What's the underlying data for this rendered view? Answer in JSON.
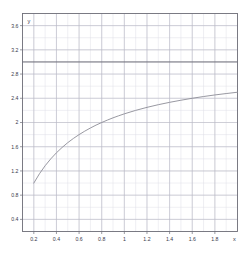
{
  "chart_data": {
    "type": "line",
    "title": "",
    "subtitle": "",
    "xlabel": "x",
    "ylabel": "y",
    "xlim": [
      0.1,
      2.0
    ],
    "ylim": [
      0.2,
      3.8
    ],
    "grid": true,
    "legend": null,
    "x_ticks": [
      "0.2",
      "0.4",
      "0.6",
      "0.8",
      "1",
      "1.2",
      "1.4",
      "1.6",
      "1.8"
    ],
    "x_tick_values": [
      0.2,
      0.4,
      0.6,
      0.8,
      1.0,
      1.2,
      1.4,
      1.6,
      1.8
    ],
    "y_ticks": [
      "0.4",
      "0.8",
      "1.2",
      "1.6",
      "2",
      "2.4",
      "2.8",
      "3.2",
      "3.6"
    ],
    "y_tick_values": [
      0.4,
      0.8,
      1.2,
      1.6,
      2.0,
      2.4,
      2.8,
      3.2,
      3.6
    ],
    "series": [
      {
        "name": "curve",
        "color": "#8c8c96",
        "x": [
          0.2,
          0.25,
          0.3,
          0.35,
          0.4,
          0.45,
          0.5,
          0.55,
          0.6,
          0.65,
          0.7,
          0.75,
          0.8,
          0.85,
          0.9,
          0.95,
          1.0,
          1.1,
          1.2,
          1.3,
          1.4,
          1.5,
          1.6,
          1.7,
          1.8,
          1.9,
          2.0
        ],
        "values": [
          1.0,
          1.154,
          1.286,
          1.4,
          1.5,
          1.588,
          1.667,
          1.737,
          1.8,
          1.857,
          1.909,
          1.957,
          2.0,
          2.04,
          2.077,
          2.111,
          2.143,
          2.2,
          2.25,
          2.294,
          2.333,
          2.368,
          2.4,
          2.429,
          2.455,
          2.478,
          2.5
        ]
      },
      {
        "name": "asymptote",
        "color": "#6e6e78",
        "kind": "horizontal-line",
        "y": 3.0
      }
    ],
    "annotations": [
      {
        "text": "horizontal asymptote at y = 3",
        "y": 3.0
      }
    ],
    "colors": {
      "curve": "#8c8c96",
      "asymptote": "#6e6e78",
      "major_grid": "#b9b9c4",
      "minor_grid": "#dedee6",
      "frame": "#6e6e78",
      "text": "#3a3a4a",
      "background": "#ffffff"
    }
  },
  "axis": {
    "x_name": "x",
    "y_name": "y"
  }
}
